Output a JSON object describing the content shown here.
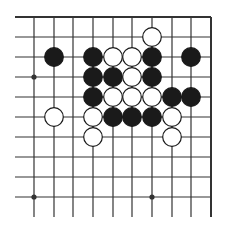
{
  "board": {
    "title": "Go problem diagram",
    "colors": {
      "line": "#333333",
      "black_stone": "#1a1a1a",
      "white_stone": "#ffffff",
      "stone_outline": "#1a1a1a"
    },
    "columns_x": [
      34,
      54,
      73,
      93,
      113,
      132,
      152,
      172,
      191,
      211
    ],
    "rows_y": [
      17,
      37,
      57,
      77,
      97,
      117,
      137,
      157,
      177,
      197,
      217
    ],
    "left_edge_x": 15,
    "top_edge_row": 0,
    "right_edge_col": 9,
    "star_points": [
      [
        0,
        3
      ],
      [
        0,
        9
      ],
      [
        6,
        9
      ]
    ],
    "stones": [
      {
        "col": 6,
        "row": 1,
        "color": "white"
      },
      {
        "col": 1,
        "row": 2,
        "color": "black"
      },
      {
        "col": 3,
        "row": 2,
        "color": "black"
      },
      {
        "col": 4,
        "row": 2,
        "color": "white"
      },
      {
        "col": 5,
        "row": 2,
        "color": "white"
      },
      {
        "col": 6,
        "row": 2,
        "color": "black"
      },
      {
        "col": 8,
        "row": 2,
        "color": "black"
      },
      {
        "col": 3,
        "row": 3,
        "color": "black"
      },
      {
        "col": 4,
        "row": 3,
        "color": "black"
      },
      {
        "col": 5,
        "row": 3,
        "color": "white"
      },
      {
        "col": 6,
        "row": 3,
        "color": "black"
      },
      {
        "col": 3,
        "row": 4,
        "color": "black"
      },
      {
        "col": 4,
        "row": 4,
        "color": "white"
      },
      {
        "col": 5,
        "row": 4,
        "color": "white"
      },
      {
        "col": 6,
        "row": 4,
        "color": "white"
      },
      {
        "col": 7,
        "row": 4,
        "color": "black"
      },
      {
        "col": 8,
        "row": 4,
        "color": "black"
      },
      {
        "col": 1,
        "row": 5,
        "color": "white"
      },
      {
        "col": 3,
        "row": 5,
        "color": "white"
      },
      {
        "col": 4,
        "row": 5,
        "color": "black"
      },
      {
        "col": 5,
        "row": 5,
        "color": "black"
      },
      {
        "col": 6,
        "row": 5,
        "color": "black"
      },
      {
        "col": 7,
        "row": 5,
        "color": "white"
      },
      {
        "col": 3,
        "row": 6,
        "color": "white"
      },
      {
        "col": 7,
        "row": 6,
        "color": "white"
      }
    ]
  }
}
